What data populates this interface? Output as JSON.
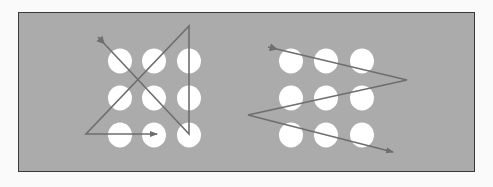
{
  "diagram": {
    "title": "",
    "background_color": "#ababab",
    "dot_color": "#ffffff",
    "line_color": "#6e6e6e",
    "panels": [
      {
        "name": "left-puzzle-solution",
        "dots": [
          [
            120,
            61
          ],
          [
            154,
            61
          ],
          [
            189,
            61
          ],
          [
            120,
            98
          ],
          [
            154,
            98
          ],
          [
            189,
            98
          ],
          [
            120,
            135
          ],
          [
            154,
            135
          ],
          [
            189,
            135
          ]
        ],
        "path": [
          [
            98,
            37
          ],
          [
            189,
            134
          ],
          [
            189,
            26
          ],
          [
            86,
            134
          ],
          [
            157,
            134
          ]
        ]
      },
      {
        "name": "right-puzzle-solution",
        "dots": [
          [
            291,
            61
          ],
          [
            326,
            61
          ],
          [
            362,
            61
          ],
          [
            291,
            98
          ],
          [
            326,
            98
          ],
          [
            362,
            98
          ],
          [
            291,
            135
          ],
          [
            326,
            135
          ],
          [
            362,
            135
          ]
        ],
        "path": [
          [
            268,
            47
          ],
          [
            407,
            80
          ],
          [
            248,
            115
          ],
          [
            393,
            152
          ]
        ]
      }
    ]
  }
}
